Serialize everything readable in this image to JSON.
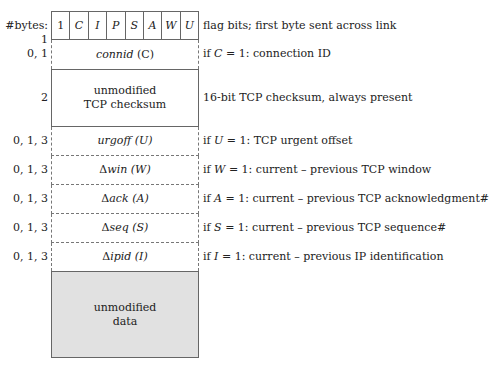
{
  "header": {
    "bytes_label": "#bytes: 1"
  },
  "flags": [
    "1",
    "C",
    "I",
    "P",
    "S",
    "A",
    "W",
    "U"
  ],
  "rows": [
    {
      "bytes": "0, 1",
      "field_italic": "connid",
      "field_suffix": " (C)",
      "desc_prefix": "if ",
      "desc_var": "C",
      "desc_rest": " = 1: connection ID"
    },
    {
      "bytes": "2",
      "field_line1": "unmodified",
      "field_line2": "TCP checksum",
      "desc": "16-bit TCP checksum, always present"
    },
    {
      "bytes": "0, 1, 3",
      "field_italic": "urgoff",
      "field_suffix": " (U)",
      "desc_prefix": "if ",
      "desc_var": "U",
      "desc_rest": " = 1: TCP urgent offset"
    },
    {
      "bytes": "0, 1, 3",
      "field_delta": "Δ",
      "field_italic": "win",
      "field_suffix": " (W)",
      "desc_prefix": "if ",
      "desc_var": "W",
      "desc_rest": " = 1: current – previous TCP window"
    },
    {
      "bytes": "0, 1, 3",
      "field_delta": "Δ",
      "field_italic": "ack",
      "field_suffix": " (A)",
      "desc_prefix": "if ",
      "desc_var": "A",
      "desc_rest": " = 1: current – previous TCP acknowledgment#"
    },
    {
      "bytes": "0, 1, 3",
      "field_delta": "Δ",
      "field_italic": "seq",
      "field_suffix": " (S)",
      "desc_prefix": "if ",
      "desc_var": "S",
      "desc_rest": " = 1: current – previous TCP sequence#"
    },
    {
      "bytes": "0, 1, 3",
      "field_delta": "Δ",
      "field_italic": "ipid",
      "field_suffix": " (I)",
      "desc_prefix": "if ",
      "desc_var": "I",
      "desc_rest": " = 1: current – previous IP identification"
    }
  ],
  "flag_desc": "flag bits; first byte sent across link",
  "data_block": {
    "line1": "unmodified",
    "line2": "data"
  },
  "colors": {
    "data_fill": "#e1e1e1",
    "border": "#666666"
  }
}
